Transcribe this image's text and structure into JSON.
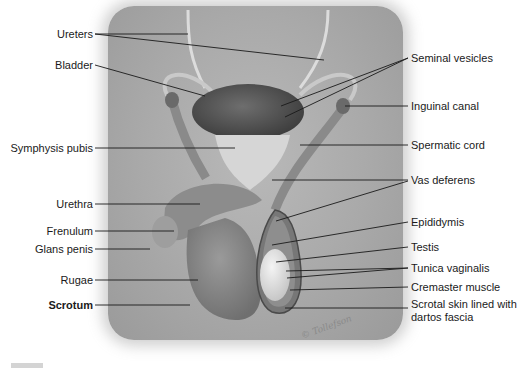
{
  "figure": {
    "background_panel_color": "#aaaaaa",
    "signature": "© Tollefson"
  },
  "labels_left": [
    {
      "text": "Ureters",
      "bold": false
    },
    {
      "text": "Bladder",
      "bold": false
    },
    {
      "text": "Symphysis pubis",
      "bold": false
    },
    {
      "text": "Urethra",
      "bold": false
    },
    {
      "text": "Frenulum",
      "bold": false
    },
    {
      "text": "Glans penis",
      "bold": false
    },
    {
      "text": "Rugae",
      "bold": false
    },
    {
      "text": "Scrotum",
      "bold": true
    }
  ],
  "labels_right": [
    {
      "text": "Seminal vesicles"
    },
    {
      "text": "Inguinal canal"
    },
    {
      "text": "Spermatic cord"
    },
    {
      "text": "Vas deferens"
    },
    {
      "text": "Epididymis"
    },
    {
      "text": "Testis"
    },
    {
      "text": "Tunica vaginalis"
    },
    {
      "text": "Cremaster muscle"
    },
    {
      "text": "Scrotal skin lined with"
    },
    {
      "text": "dartos fascia"
    }
  ]
}
